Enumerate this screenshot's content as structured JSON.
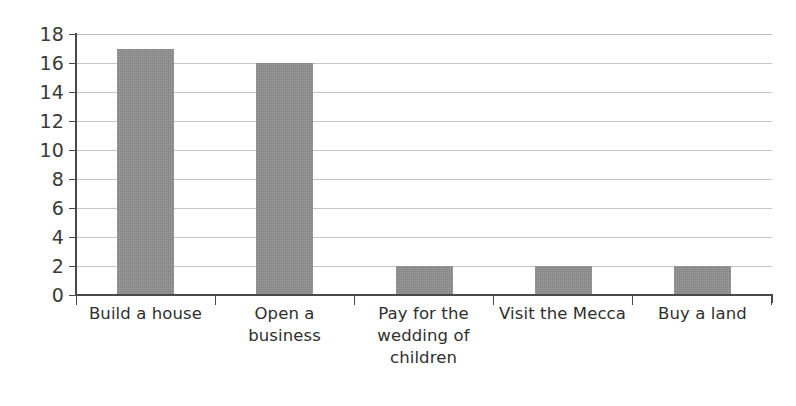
{
  "chart_data": {
    "type": "bar",
    "title": "",
    "subtitle": "",
    "xlabel": "",
    "ylabel": "",
    "categories": [
      "Build a house",
      "Open a business",
      "Pay for the wedding of children",
      "Visit the Mecca",
      "Buy a land"
    ],
    "values": [
      17,
      16,
      2,
      2,
      2
    ],
    "ylim": [
      0,
      18
    ],
    "ytick_labels": [
      "18",
      "16",
      "14",
      "12",
      "10",
      "8",
      "6",
      "4",
      "2",
      "0"
    ],
    "ytick_values": [
      18,
      16,
      14,
      12,
      10,
      8,
      6,
      4,
      2,
      0
    ],
    "ytick_step": 2,
    "grid": true,
    "grid_axis": "y",
    "legend": false,
    "legend_position": "none",
    "series": [
      {
        "name": "Count",
        "values": [
          17,
          16,
          2,
          2,
          2
        ]
      }
    ],
    "annotations": []
  },
  "style": {
    "bar_color": "#8f8f8f",
    "gridline_color": "#c6c6c6",
    "axis_color": "#4a4a4a",
    "text_color": "#2f2f2f",
    "background_color": "#ffffff"
  },
  "x_label_lines": [
    [
      "Build a house"
    ],
    [
      "Open a",
      "business"
    ],
    [
      "Pay for the",
      "wedding of",
      "children"
    ],
    [
      "Visit the Mecca"
    ],
    [
      "Buy a land"
    ]
  ]
}
